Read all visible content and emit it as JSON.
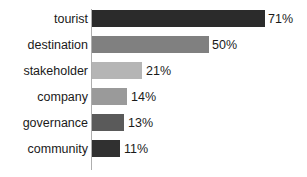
{
  "chart_data": {
    "type": "bar",
    "orientation": "horizontal",
    "title": "",
    "xlabel": "",
    "ylabel": "",
    "grid": false,
    "legend": false,
    "axis_line": true,
    "xlim": [
      0,
      71
    ],
    "categories": [
      "tourist",
      "destination",
      "stakeholder",
      "company",
      "governance",
      "community"
    ],
    "values": [
      71,
      50,
      21,
      14,
      13,
      11
    ],
    "value_labels": [
      "71%",
      "50%",
      "21%",
      "14%",
      "13%",
      "11%"
    ],
    "bar_colors": [
      "#2b2b2b",
      "#808080",
      "#b5b5b5",
      "#9a9a9a",
      "#5a5a5a",
      "#303030"
    ],
    "bars": [
      {
        "category": "tourist",
        "value": 71,
        "label": "71%",
        "color": "#2b2b2b",
        "bar_px": 173,
        "label_x_px": 268
      },
      {
        "category": "destination",
        "value": 50,
        "label": "50%",
        "color": "#808080",
        "bar_px": 117,
        "label_x_px": 212
      },
      {
        "category": "stakeholder",
        "value": 21,
        "label": "21%",
        "color": "#b5b5b5",
        "bar_px": 50,
        "label_x_px": 146
      },
      {
        "category": "company",
        "value": 14,
        "label": "14%",
        "color": "#9a9a9a",
        "bar_px": 35,
        "label_x_px": 131
      },
      {
        "category": "governance",
        "value": 13,
        "label": "13%",
        "color": "#5a5a5a",
        "bar_px": 32,
        "label_x_px": 128
      },
      {
        "category": "community",
        "value": 11,
        "label": "11%",
        "color": "#303030",
        "bar_px": 28,
        "label_x_px": 124
      }
    ]
  },
  "colors": {
    "background": "#ffffff",
    "text": "#1a1a1a",
    "axis": "#aeaeae"
  }
}
